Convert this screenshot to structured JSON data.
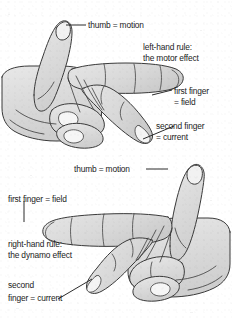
{
  "figure": {
    "colors": {
      "background": "#ffffff",
      "hand_fill": "#d9d9d9",
      "hand_fill_light": "#ededed",
      "outline": "#3a3a3a",
      "text": "#1b1b1b",
      "leader_line": "#2b2b2b"
    }
  },
  "top_diagram": {
    "name": "left-hand-rule",
    "rule_title_line1": "left-hand rule:",
    "rule_title_line2": "the motor effect",
    "labels": {
      "thumb": "thumb = motion",
      "first_finger_line1": "first finger",
      "first_finger_line2": "= field",
      "second_finger_line1": "second finger",
      "second_finger_line2": "= current"
    }
  },
  "bottom_diagram": {
    "name": "right-hand-rule",
    "rule_title_line1": "right-hand rule:",
    "rule_title_line2": "the dynamo effect",
    "labels": {
      "thumb": "thumb = motion",
      "first_finger": "first finger = field",
      "second_finger_line1": "second",
      "second_finger_line2": "finger = current"
    }
  }
}
